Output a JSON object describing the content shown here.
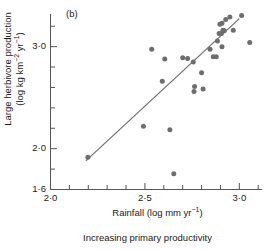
{
  "panel": {
    "label": "(b)"
  },
  "caption": "Increasing primary productivity",
  "style": {
    "point_color": "#6e6e6e",
    "line_color": "#6e6e6e",
    "axis_color": "#555555",
    "text_color": "#1a1a1a"
  },
  "axes": {
    "y": {
      "title_line1": "Large herbivore production",
      "title_line2_pre": "(log kg km",
      "title_line2_sup1": "−2",
      "title_line2_mid": " yr",
      "title_line2_sup2": "−1",
      "title_line2_post": ")",
      "tick_labels": [
        "3·0",
        "2·0",
        "1·6"
      ]
    },
    "x": {
      "title_pre": "Rainfall (log mm yr",
      "title_sup": "−1",
      "title_post": ")",
      "tick_labels": [
        "2·0",
        "2·5",
        "3·0"
      ]
    }
  },
  "chart_data": {
    "type": "scatter",
    "title": "(b)",
    "xlabel": "Rainfall (log mm yr⁻¹)",
    "ylabel": "Large herbivore production (log kg km⁻² yr⁻¹)",
    "subtitle": "Increasing primary productivity",
    "xlim": [
      2.0,
      3.12
    ],
    "ylim": [
      1.6,
      3.32
    ],
    "xticks": [
      2.0,
      2.5,
      3.0
    ],
    "xtick_labels": [
      "2·0",
      "2·5",
      "3·0"
    ],
    "x_minor_ticks": [
      2.1,
      2.2,
      2.3,
      2.4,
      2.6,
      2.7,
      2.8,
      2.9,
      3.1
    ],
    "yticks": [
      1.6,
      2.0,
      3.0
    ],
    "ytick_labels": [
      "1·6",
      "2·0",
      "3·0"
    ],
    "y_minor_ticks": [
      1.8,
      2.2,
      2.4,
      2.6,
      2.8,
      3.2
    ],
    "grid": false,
    "legend": false,
    "points": [
      [
        2.198,
        1.915
      ],
      [
        2.492,
        2.22
      ],
      [
        2.536,
        2.975
      ],
      [
        2.605,
        2.88
      ],
      [
        2.592,
        2.66
      ],
      [
        2.632,
        2.185
      ],
      [
        2.653,
        1.755
      ],
      [
        2.726,
        2.885
      ],
      [
        2.756,
        2.85
      ],
      [
        2.763,
        2.61
      ],
      [
        2.76,
        2.56
      ],
      [
        2.8,
        2.745
      ],
      [
        2.808,
        2.585
      ],
      [
        2.878,
        2.9
      ],
      [
        2.884,
        3.055
      ],
      [
        2.897,
        3.22
      ],
      [
        2.908,
        3.0
      ],
      [
        2.905,
        3.13
      ],
      [
        2.913,
        3.16
      ],
      [
        2.92,
        3.155
      ],
      [
        2.893,
        3.13
      ],
      [
        2.908,
        3.23
      ],
      [
        2.928,
        3.265
      ],
      [
        2.95,
        3.29
      ],
      [
        2.968,
        3.16
      ],
      [
        3.012,
        3.305
      ],
      [
        3.055,
        3.04
      ],
      [
        2.862,
        2.9
      ],
      [
        2.845,
        2.975
      ],
      [
        2.7,
        2.89
      ]
    ],
    "fit_line": {
      "x_start": 2.187,
      "y_start": 1.88,
      "x_end": 3.0,
      "y_end": 3.275
    }
  }
}
